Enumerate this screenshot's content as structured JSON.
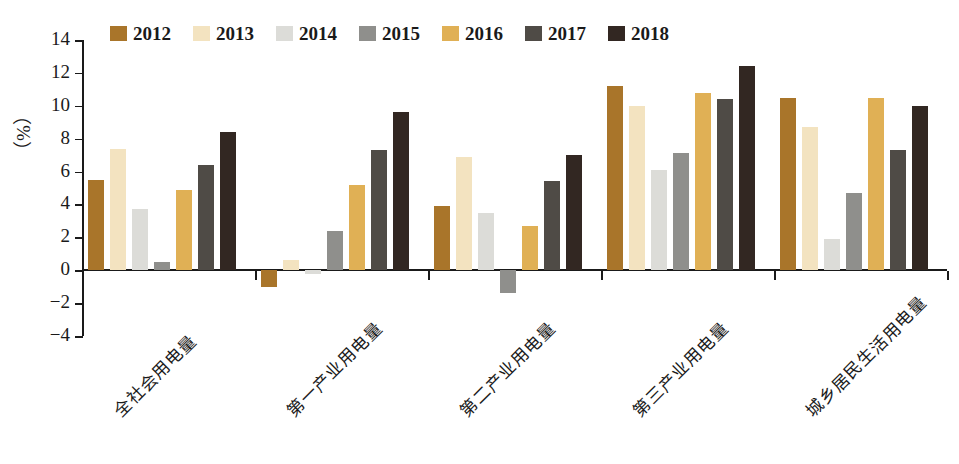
{
  "chart_data": {
    "type": "bar",
    "title": "",
    "xlabel": "",
    "ylabel": "（%）",
    "ylim": [
      -4,
      14
    ],
    "ytick_step": 2,
    "yticks": [
      "14",
      "12",
      "10",
      "8",
      "6",
      "4",
      "2",
      "0",
      "-2",
      "-4"
    ],
    "grid": false,
    "legend_position": "top-left",
    "categories": [
      "全社会用电量",
      "第一产业用电量",
      "第二产业用电量",
      "第三产业用电量",
      "城乡居民生活用电量"
    ],
    "series": [
      {
        "name": "2012",
        "color": "#a9752a",
        "values": [
          5.5,
          -1.0,
          3.9,
          11.2,
          10.5
        ]
      },
      {
        "name": "2013",
        "color": "#f3e3c0",
        "values": [
          7.4,
          0.6,
          6.9,
          10.0,
          8.7
        ]
      },
      {
        "name": "2014",
        "color": "#dcdcd8",
        "values": [
          3.7,
          -0.25,
          3.5,
          6.1,
          1.9
        ]
      },
      {
        "name": "2015",
        "color": "#8f8f8c",
        "values": [
          0.5,
          2.4,
          -1.4,
          7.1,
          4.7
        ]
      },
      {
        "name": "2016",
        "color": "#e0b055",
        "values": [
          4.9,
          5.2,
          2.7,
          10.8,
          10.5
        ]
      },
      {
        "name": "2017",
        "color": "#4f4b46",
        "values": [
          6.4,
          7.3,
          5.4,
          10.4,
          7.3
        ]
      },
      {
        "name": "2018",
        "color": "#322722",
        "values": [
          8.4,
          9.6,
          7.0,
          12.4,
          10.0
        ]
      }
    ]
  },
  "legend": {
    "items": [
      {
        "label": "2012"
      },
      {
        "label": "2013"
      },
      {
        "label": "2014"
      },
      {
        "label": "2015"
      },
      {
        "label": "2016"
      },
      {
        "label": "2017"
      },
      {
        "label": "2018"
      }
    ]
  },
  "axis": {
    "y_title": "（%）"
  }
}
